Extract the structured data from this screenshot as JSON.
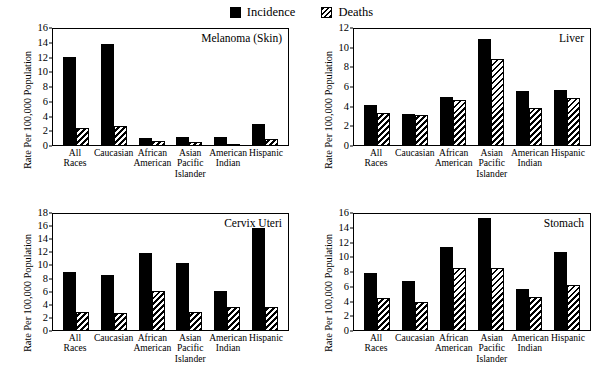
{
  "legend": {
    "entries": [
      {
        "label": "Incidence",
        "swatch": "solid-square-icon",
        "color": "#000000"
      },
      {
        "label": "Deaths",
        "swatch": "hatched-square-icon",
        "color": "#000000"
      }
    ]
  },
  "axis": {
    "ylabel": "Rate Per 100,000 Population",
    "categories": [
      "All\nRaces",
      "Caucasian",
      "African\nAmerican",
      "Asian\nPacific\nIslander",
      "American\nIndian",
      "Hispanic"
    ]
  },
  "chart_data": [
    {
      "type": "bar",
      "title": "Melanoma (Skin)",
      "panel": "top-left",
      "xlabel": "",
      "ylabel": "Rate Per 100,000 Population",
      "ylim": [
        0,
        16
      ],
      "yticks": [
        0,
        2,
        4,
        6,
        8,
        10,
        12,
        14,
        16
      ],
      "grid": false,
      "legend_position": "figure-top-center",
      "categories": [
        "All Races",
        "Caucasian",
        "African American",
        "Asian Pacific Islander",
        "American Indian",
        "Hispanic"
      ],
      "series": [
        {
          "name": "Incidence",
          "values": [
            12.1,
            14.0,
            0.9,
            1.1,
            1.1,
            2.9
          ]
        },
        {
          "name": "Deaths",
          "values": [
            2.3,
            2.6,
            0.5,
            0.4,
            0.1,
            0.8
          ]
        }
      ]
    },
    {
      "type": "bar",
      "title": "Liver",
      "panel": "top-right",
      "xlabel": "",
      "ylabel": "Rate Per 100,000 Population",
      "ylim": [
        0,
        12
      ],
      "yticks": [
        0,
        2,
        4,
        6,
        8,
        10,
        12
      ],
      "grid": false,
      "legend_position": "figure-top-center",
      "categories": [
        "All Races",
        "Caucasian",
        "African American",
        "Asian Pacific Islander",
        "American Indian",
        "Hispanic"
      ],
      "series": [
        {
          "name": "Incidence",
          "values": [
            4.1,
            3.2,
            5.0,
            11.0,
            5.6,
            5.7
          ]
        },
        {
          "name": "Deaths",
          "values": [
            3.3,
            3.1,
            4.7,
            8.9,
            3.8,
            4.9
          ]
        }
      ]
    },
    {
      "type": "bar",
      "title": "Cervix Uteri",
      "panel": "bottom-left",
      "xlabel": "",
      "ylabel": "Rate Per 100,000 Population",
      "ylim": [
        0,
        18
      ],
      "yticks": [
        0,
        2,
        4,
        6,
        8,
        10,
        12,
        14,
        16,
        18
      ],
      "grid": false,
      "legend_position": "figure-top-center",
      "categories": [
        "All Races",
        "Caucasian",
        "African American",
        "Asian Pacific Islander",
        "American Indian",
        "Hispanic"
      ],
      "series": [
        {
          "name": "Incidence",
          "values": [
            9.0,
            8.6,
            11.9,
            10.4,
            6.1,
            15.9
          ]
        },
        {
          "name": "Deaths",
          "values": [
            2.8,
            2.6,
            6.1,
            2.8,
            3.6,
            3.5
          ]
        }
      ]
    },
    {
      "type": "bar",
      "title": "Stomach",
      "panel": "bottom-right",
      "xlabel": "",
      "ylabel": "Rate Per 100,000 Population",
      "ylim": [
        0,
        16
      ],
      "yticks": [
        0,
        2,
        4,
        6,
        8,
        10,
        12,
        14,
        16
      ],
      "grid": false,
      "legend_position": "figure-top-center",
      "categories": [
        "All Races",
        "Caucasian",
        "African American",
        "Asian Pacific Islander",
        "American Indian",
        "Hispanic"
      ],
      "series": [
        {
          "name": "Incidence",
          "values": [
            7.8,
            6.7,
            11.5,
            15.4,
            5.6,
            10.7
          ]
        },
        {
          "name": "Deaths",
          "values": [
            4.4,
            3.9,
            8.5,
            8.6,
            4.5,
            6.2
          ]
        }
      ]
    }
  ]
}
